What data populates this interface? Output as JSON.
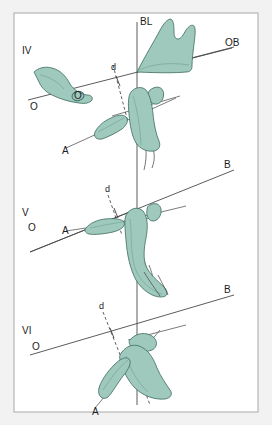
{
  "figure": {
    "background_color": "#f2f2f2",
    "panel_color": "#ffffff",
    "border_color": "#a8a8a8",
    "bone_fill": "#9fc9bd",
    "bone_stroke": "#3c6b60",
    "line_color": "#4a4a4a",
    "width": 272,
    "height": 425
  },
  "labels": {
    "panel_iv": "IV",
    "panel_v": "V",
    "panel_vi": "VI",
    "bl": "BL",
    "ob": "OB",
    "b_middle": "B",
    "b_bottom": "B",
    "o_iv": "O",
    "o_v": "O",
    "o_vi": "O",
    "o_on_bone": "O",
    "d_iv": "d",
    "d_v": "d",
    "d_vi": "d",
    "a_iv": "A",
    "a_v": "A",
    "a_vi": "A"
  },
  "panels": [
    {
      "id": "IV",
      "name": "IV",
      "reference_lines": [
        {
          "name": "BL",
          "type": "vertical-solid"
        },
        {
          "name": "OB",
          "type": "oblique-solid"
        },
        {
          "name": "O",
          "type": "oblique-solid"
        },
        {
          "name": "d",
          "type": "dashed"
        },
        {
          "name": "A",
          "type": "oblique-solid"
        }
      ]
    },
    {
      "id": "V",
      "name": "V",
      "reference_lines": [
        {
          "name": "B",
          "type": "oblique-solid"
        },
        {
          "name": "O",
          "type": "oblique-solid"
        },
        {
          "name": "d",
          "type": "dashed"
        },
        {
          "name": "A",
          "type": "oblique-solid"
        }
      ]
    },
    {
      "id": "VI",
      "name": "VI",
      "reference_lines": [
        {
          "name": "B",
          "type": "oblique-solid"
        },
        {
          "name": "O",
          "type": "oblique-solid"
        },
        {
          "name": "d",
          "type": "dashed"
        },
        {
          "name": "A",
          "type": "oblique-solid"
        }
      ]
    }
  ]
}
